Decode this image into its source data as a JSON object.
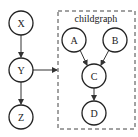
{
  "diagram": {
    "cluster": {
      "label": "childgraph"
    },
    "nodes": {
      "X": {
        "label": "X"
      },
      "Y": {
        "label": "Y"
      },
      "Z": {
        "label": "Z"
      },
      "A": {
        "label": "A"
      },
      "B": {
        "label": "B"
      },
      "C": {
        "label": "C"
      },
      "D": {
        "label": "D"
      }
    },
    "edges": [
      {
        "from": "X",
        "to": "Y"
      },
      {
        "from": "Y",
        "to": "Z"
      },
      {
        "from": "Y",
        "to": "childgraph"
      },
      {
        "from": "A",
        "to": "C"
      },
      {
        "from": "B",
        "to": "C"
      },
      {
        "from": "C",
        "to": "D"
      }
    ]
  }
}
